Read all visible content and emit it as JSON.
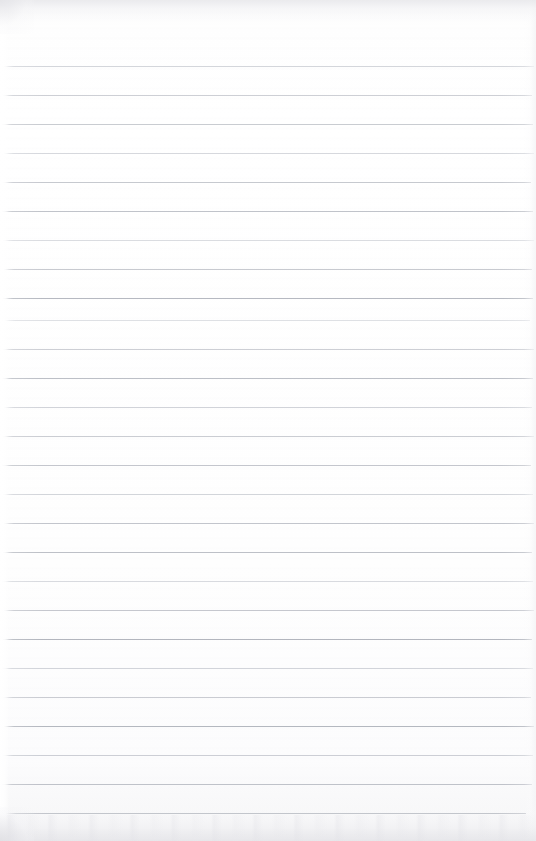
{
  "document": {
    "kind": "scanned-lined-notebook-page",
    "title": "Blank Lined Notebook Page",
    "page_text": "",
    "handwriting_present": "no",
    "printed_text_present": "no",
    "orientation": "portrait",
    "width_px": 536,
    "height_px": 841
  },
  "paper": {
    "background_color": "#fdfdfd",
    "tone_top_color": "#f8f8f9",
    "tone_bottom_color": "#f2f2f3",
    "left_margin_visible": "no",
    "margin_rule_visible": "no",
    "holes_visible": "no",
    "header_visible": "no"
  },
  "rules": {
    "label": "horizontal ruled lines",
    "color_light": "#c8cbd2",
    "color_mid": "#b9bcc4",
    "color_dark": "#a9adb6",
    "thickness_px": 1,
    "spacing_px": 29,
    "first_line_y": 66,
    "count": 27,
    "positions_y": [
      66,
      95,
      124,
      153,
      182,
      211,
      240,
      269,
      298,
      320,
      349,
      378,
      407,
      436,
      465,
      494,
      523,
      552,
      581,
      610,
      639,
      668,
      697,
      726,
      755,
      784,
      813
    ],
    "opacities": [
      0.78,
      0.7,
      0.62,
      0.74,
      0.8,
      0.72,
      0.66,
      0.78,
      0.84,
      0.58,
      0.7,
      0.76,
      0.82,
      0.74,
      0.68,
      0.8,
      0.86,
      0.76,
      0.7,
      0.82,
      0.88,
      0.8,
      0.74,
      0.86,
      0.92,
      0.9,
      0.84
    ],
    "insets_left_px": [
      4,
      3,
      2,
      4,
      3,
      2,
      3,
      4,
      3,
      5,
      3,
      2,
      4,
      3,
      2,
      3,
      4,
      3,
      2,
      4,
      3,
      2,
      3,
      4,
      3,
      2,
      6
    ],
    "insets_right_px": [
      2,
      4,
      3,
      2,
      5,
      3,
      2,
      4,
      3,
      6,
      2,
      3,
      4,
      2,
      5,
      3,
      2,
      4,
      3,
      2,
      4,
      3,
      5,
      2,
      3,
      4,
      10
    ]
  },
  "artifacts": {
    "top_scan_shadow": "yes",
    "bottom_scan_shadow": "yes",
    "left_gutter_highlight": "yes",
    "right_edge_shading": "yes",
    "speckle_noise": "faint"
  }
}
